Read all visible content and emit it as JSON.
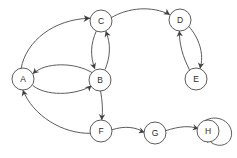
{
  "diagram": {
    "type": "directed-graph",
    "canvas": {
      "width": 237,
      "height": 158,
      "background": "#ffffff"
    },
    "style": {
      "edge_color": "#4a4a4a",
      "node_stroke": "#4a4a4a",
      "node_fill": "#ffffff",
      "label_color": "#2a2a2a",
      "arrow_color": "#3f3f3f",
      "node_radius": 11,
      "stroke_width": 0.9
    },
    "nodes": [
      {
        "id": "A",
        "label": "A",
        "cx": 23,
        "cy": 79,
        "r": 11
      },
      {
        "id": "B",
        "label": "B",
        "cx": 100,
        "cy": 80,
        "r": 11
      },
      {
        "id": "C",
        "label": "C",
        "cx": 101,
        "cy": 21,
        "r": 11
      },
      {
        "id": "D",
        "label": "D",
        "cx": 180,
        "cy": 20,
        "r": 11
      },
      {
        "id": "E",
        "label": "E",
        "cx": 196,
        "cy": 79,
        "r": 11
      },
      {
        "id": "F",
        "label": "F",
        "cx": 101,
        "cy": 131,
        "r": 11
      },
      {
        "id": "G",
        "label": "G",
        "cx": 155,
        "cy": 133,
        "r": 11
      },
      {
        "id": "H",
        "label": "H",
        "cx": 208,
        "cy": 131,
        "r": 11
      }
    ],
    "edges": [
      {
        "id": "A-C",
        "from": "A",
        "to": "C",
        "directed": true,
        "shape": "curve"
      },
      {
        "id": "C-D",
        "from": "C",
        "to": "D",
        "directed": true,
        "shape": "curve"
      },
      {
        "id": "C-B",
        "from": "C",
        "to": "B",
        "directed": true,
        "shape": "curve"
      },
      {
        "id": "B-C",
        "from": "B",
        "to": "C",
        "directed": true,
        "shape": "curve"
      },
      {
        "id": "A-B",
        "from": "A",
        "to": "B",
        "directed": true,
        "shape": "curve"
      },
      {
        "id": "B-A",
        "from": "B",
        "to": "A",
        "directed": true,
        "shape": "curve"
      },
      {
        "id": "D-E",
        "from": "D",
        "to": "E",
        "directed": true,
        "shape": "curve"
      },
      {
        "id": "E-D",
        "from": "E",
        "to": "D",
        "directed": true,
        "shape": "curve"
      },
      {
        "id": "B-F",
        "from": "B",
        "to": "F",
        "directed": true,
        "shape": "curve"
      },
      {
        "id": "F-A",
        "from": "F",
        "to": "A",
        "directed": true,
        "shape": "curve"
      },
      {
        "id": "F-G",
        "from": "F",
        "to": "G",
        "directed": true,
        "shape": "curve"
      },
      {
        "id": "G-H",
        "from": "G",
        "to": "H",
        "directed": true,
        "shape": "curve"
      },
      {
        "id": "H-H",
        "from": "H",
        "to": "H",
        "directed": true,
        "shape": "self-loop"
      }
    ]
  }
}
